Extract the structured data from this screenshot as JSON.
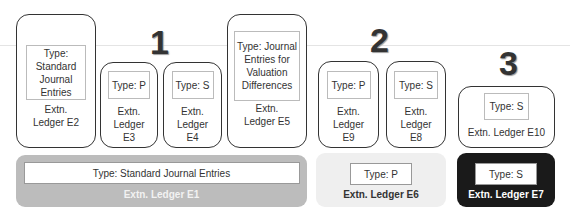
{
  "group_numbers": [
    "1",
    "2",
    "3"
  ],
  "ledgers": {
    "e2": {
      "type": "Type: Standard Journal Entries",
      "name": "Extn. Ledger E2"
    },
    "e3": {
      "type": "Type: P",
      "name": "Extn. Ledger E3"
    },
    "e4": {
      "type": "Type: S",
      "name": "Extn. Ledger E4"
    },
    "e5": {
      "type": "Type: Journal Entries for Valuation Differences",
      "name": "Extn. Ledger E5"
    },
    "e9": {
      "type": "Type: P",
      "name": "Extn. Ledger E9"
    },
    "e8": {
      "type": "Type: S",
      "name": "Extn. Ledger E8"
    },
    "e10": {
      "type": "Type: S",
      "name": "Extn. Ledger E10"
    }
  },
  "base_ledgers": {
    "e1": {
      "type": "Type: Standard Journal Entries",
      "name": "Extn. Ledger E1",
      "color": "#b8b8b8"
    },
    "e6": {
      "type": "Type: P",
      "name": "Extn. Ledger E6",
      "color": "#efefef"
    },
    "e7": {
      "type": "Type: S",
      "name": "Extn. Ledger E7",
      "color": "#1a1a1a"
    }
  }
}
